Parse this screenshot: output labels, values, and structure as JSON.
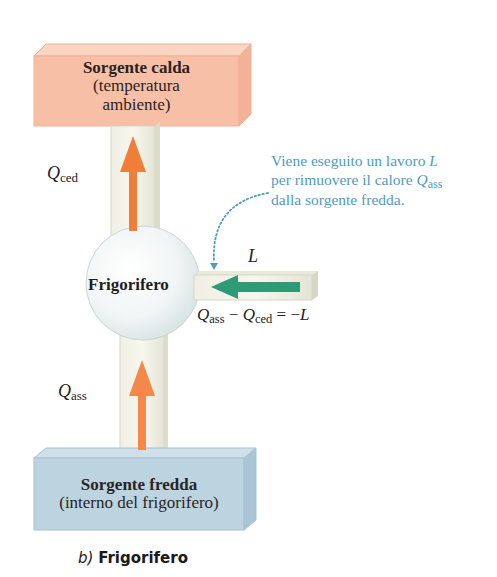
{
  "diagram": {
    "hot_reservoir": {
      "title": "Sorgente calda",
      "subtitle_line1": "(temperatura",
      "subtitle_line2": "ambiente)",
      "color": "#f7bfa6"
    },
    "cold_reservoir": {
      "title": "Sorgente fredda",
      "subtitle": "(interno del frigorifero)",
      "color": "#bcd3e0"
    },
    "engine": {
      "label": "Frigorifero"
    },
    "heat_out": {
      "symbol": "Q",
      "subscript": "ced",
      "arrow_direction": "up",
      "arrow_color": "#f07d3a"
    },
    "heat_in": {
      "symbol": "Q",
      "subscript": "ass",
      "arrow_direction": "up",
      "arrow_color": "#f07d3a"
    },
    "work": {
      "symbol": "L",
      "arrow_direction": "left",
      "arrow_color": "#2e9a76"
    },
    "equation": {
      "q1": "Q",
      "q1_sub": "ass",
      "minus": " − ",
      "q2": "Q",
      "q2_sub": "ced",
      "rhs": " = −",
      "rhs_symbol": "L"
    },
    "annotation": {
      "line1": "Viene eseguito un lavoro ",
      "line1_symbol": "L",
      "line2": "per rimuovere il calore ",
      "line2_symbol": "Q",
      "line2_sub": "ass",
      "line3": "dalla sorgente fredda.",
      "color": "#4c9cc6"
    },
    "caption": {
      "letter": "b)",
      "title": "Frigorifero"
    }
  }
}
